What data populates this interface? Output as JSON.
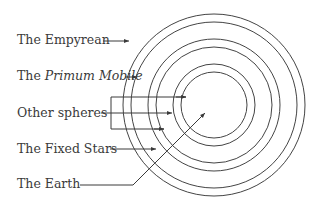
{
  "diagram": {
    "type": "concentric-spheres",
    "labels": [
      {
        "id": "empyrean",
        "prefix": "The ",
        "text": "Empyrean",
        "italic": false
      },
      {
        "id": "primum-mobile",
        "prefix": "The ",
        "text": "Primum Mobile",
        "italic": true
      },
      {
        "id": "other-spheres",
        "prefix": "",
        "text": "Other spheres",
        "italic": false
      },
      {
        "id": "fixed-stars",
        "prefix": "The ",
        "text": "Fixed Stars",
        "italic": false
      },
      {
        "id": "earth",
        "prefix": "The ",
        "text": "Earth",
        "italic": false
      }
    ],
    "circles": {
      "center": [
        214,
        105
      ],
      "radii": [
        91,
        83,
        66,
        58,
        41,
        33
      ]
    },
    "colors": {
      "line": "#3a3a3a",
      "text": "#3a3a3a",
      "background": "#ffffff"
    }
  }
}
